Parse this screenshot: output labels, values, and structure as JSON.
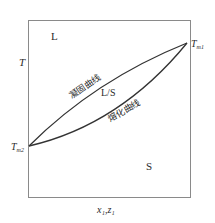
{
  "diagram": {
    "type": "phase-diagram",
    "axis": {
      "y_label": "T",
      "x_label": "x₁,z₁"
    },
    "regions": {
      "liquid": "L",
      "two_phase": "L/S",
      "solid": "S"
    },
    "points": {
      "tm1": {
        "base": "T",
        "sub": "m1"
      },
      "tm2": {
        "base": "T",
        "sub": "m2"
      }
    },
    "curves": {
      "freezing": "凝固曲线",
      "melting": "熔化曲线"
    },
    "colors": {
      "line": "#333333",
      "frame": "#8a8a8a",
      "text": "#2a2a2a"
    }
  }
}
